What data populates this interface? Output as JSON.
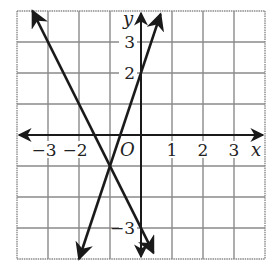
{
  "chart_data": {
    "type": "line",
    "title": "",
    "xlabel": "x",
    "ylabel": "y",
    "origin_label": "O",
    "xlim": [
      -4,
      4
    ],
    "ylim": [
      -4,
      4
    ],
    "grid": true,
    "x_ticks": [
      {
        "value": -3,
        "label": "−3"
      },
      {
        "value": -2,
        "label": "−2"
      },
      {
        "value": 1,
        "label": "1"
      },
      {
        "value": 2,
        "label": "2"
      },
      {
        "value": 3,
        "label": "3"
      }
    ],
    "y_ticks": [
      {
        "value": 3,
        "label": "3"
      },
      {
        "value": 2,
        "label": "2"
      },
      {
        "value": -3,
        "label": "−3"
      }
    ],
    "series": [
      {
        "name": "line-1",
        "equation": "y = 3x + 2",
        "slope": 3,
        "intercept": 2,
        "x": [
          -2,
          0.63
        ],
        "y": [
          -4,
          3.9
        ]
      },
      {
        "name": "line-2",
        "equation": "y = -2x - 3",
        "slope": -2,
        "intercept": -3,
        "x": [
          -3.5,
          0.4
        ],
        "y": [
          4,
          -3.8
        ]
      }
    ],
    "intersection": {
      "x": -1,
      "y": -1
    }
  },
  "colors": {
    "grid": "#8a8a8a",
    "axis": "#1a1a1a",
    "line": "#1a1a1a"
  }
}
